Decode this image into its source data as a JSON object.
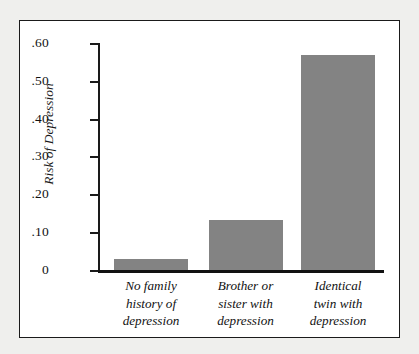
{
  "chart_data": {
    "type": "bar",
    "title": "",
    "subtitle": "",
    "xlabel": "",
    "ylabel": "Risk of Depression",
    "categories": [
      "No family history of depression",
      "Brother or sister with depression",
      "Identical twin with depression"
    ],
    "category_lines": [
      [
        "No family",
        "history of",
        "depression"
      ],
      [
        "Brother or",
        "sister with",
        "depression"
      ],
      [
        "Identical",
        "twin with",
        "depression"
      ]
    ],
    "values": [
      0.03,
      0.135,
      0.57
    ],
    "ylim": [
      0,
      0.6
    ],
    "ytick_values": [
      0.6,
      0.5,
      0.4,
      0.3,
      0.2,
      0.1,
      0
    ],
    "ytick_labels": [
      ".60",
      ".50",
      ".40",
      ".30",
      ".20",
      ".10",
      "0"
    ],
    "grid": false,
    "legend": false,
    "legend_position": "none",
    "bar_color": "#838383",
    "axis_color": "#1a1a1a",
    "plot_background": "#ffffff",
    "figure_background": "#efefed"
  },
  "axis": {
    "y_title": "Risk of Depression"
  }
}
